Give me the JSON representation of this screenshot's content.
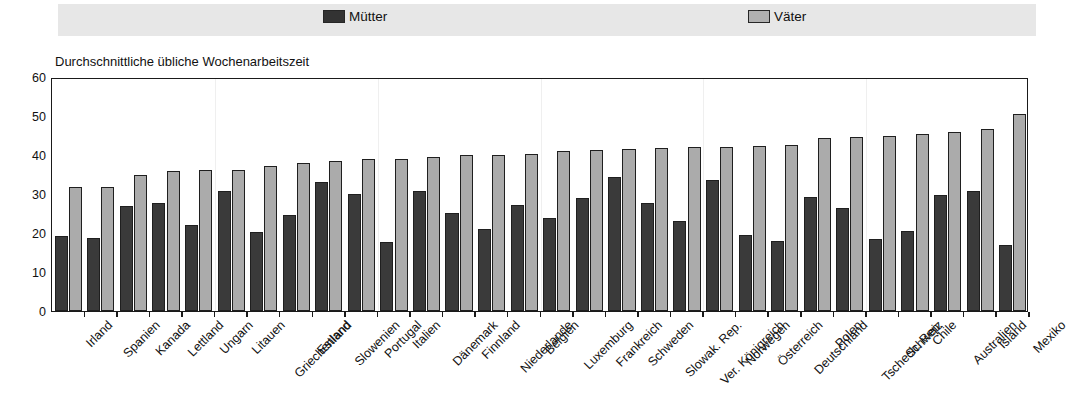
{
  "chart_title": "Durchschnittliche übliche Wochenarbeitszeit",
  "legend": {
    "items": [
      {
        "label": "Mütter",
        "color": "#3a3a3a",
        "swatch": "dark"
      },
      {
        "label": "Väter",
        "color": "#ababab",
        "swatch": "light"
      }
    ]
  },
  "chart_data": {
    "type": "bar",
    "title": "Durchschnittliche übliche Wochenarbeitszeit",
    "xlabel": "",
    "ylabel": "",
    "ylim": [
      0,
      60
    ],
    "yticks": [
      0,
      10,
      20,
      30,
      40,
      50,
      60
    ],
    "grid": true,
    "legend_position": "top",
    "categories": [
      "Irland",
      "Spanien",
      "Kanada",
      "Lettland",
      "Ungarn",
      "Litauen",
      "Griechenland",
      "Estland",
      "Slowenien",
      "Portugal",
      "Italien",
      "Dänemark",
      "Finnland",
      "Niederlande",
      "Belgien",
      "Luxemburg",
      "Frankreich",
      "Schweden",
      "Slowak. Rep.",
      "Ver. Königreich",
      "Norwegen",
      "Österreich",
      "Deutschland",
      "Polen",
      "Tschech. Rep.",
      "Schweiz",
      "Chile",
      "Australien",
      "Island",
      "Mexiko"
    ],
    "series": [
      {
        "name": "Mütter",
        "color": "#3a3a3a",
        "values": [
          19.3,
          18.8,
          27.0,
          27.7,
          22.0,
          30.9,
          20.2,
          24.7,
          33.2,
          29.9,
          17.6,
          30.9,
          25.1,
          21.0,
          27.2,
          23.8,
          29.0,
          34.4,
          27.7,
          23.0,
          33.5,
          19.5,
          17.9,
          29.2,
          26.3,
          18.4,
          20.6,
          29.8,
          30.9,
          16.8
        ]
      },
      {
        "name": "Väter",
        "color": "#ababab",
        "values": [
          31.8,
          31.9,
          34.8,
          35.8,
          36.1,
          36.2,
          37.1,
          38.0,
          38.4,
          38.9,
          39.0,
          39.6,
          39.9,
          40.0,
          40.2,
          41.0,
          41.2,
          41.6,
          41.8,
          42.0,
          42.1,
          42.4,
          42.6,
          44.3,
          44.6,
          45.0,
          45.4,
          45.8,
          46.7,
          50.4
        ]
      }
    ]
  }
}
